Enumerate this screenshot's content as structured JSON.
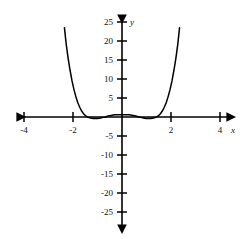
{
  "chart_data": {
    "type": "line",
    "title": "",
    "subtitle": "",
    "xlabel": "x",
    "ylabel": "y",
    "xlim": [
      -4.6,
      4.6
    ],
    "ylim": [
      -27.5,
      27.5
    ],
    "grid": false,
    "legend": null,
    "x_ticks": [
      -4,
      -2,
      2,
      4
    ],
    "x_tick_labels": [
      "-4",
      "-2",
      "2",
      "4"
    ],
    "y_ticks": [
      -25,
      -20,
      -15,
      -10,
      -5,
      5,
      10,
      15,
      20,
      25
    ],
    "y_tick_labels": [
      "-25",
      "-20",
      "-15",
      "-10",
      "-5",
      "5",
      "10",
      "15",
      "20",
      "25"
    ],
    "axis_arrows": true,
    "series": [
      {
        "name": "curve",
        "color": "#000000",
        "x": [
          -2.42,
          -2.35,
          -2.28,
          -2.2,
          -2.12,
          -2.04,
          -1.96,
          -1.88,
          -1.8,
          -1.72,
          -1.64,
          -1.56,
          -1.48,
          -1.4,
          -1.32,
          -1.24,
          -1.16,
          -1.08,
          -1.0,
          -0.92,
          -0.84,
          -0.76,
          -0.68,
          -0.6,
          -0.52,
          -0.44,
          -0.36,
          -0.28,
          -0.2,
          -0.12,
          -0.04,
          0.04,
          0.12,
          0.2,
          0.28,
          0.36,
          0.44,
          0.52,
          0.6,
          0.68,
          0.76,
          0.84,
          0.92,
          1.0,
          1.08,
          1.16,
          1.24,
          1.32,
          1.4,
          1.48,
          1.56,
          1.64,
          1.72,
          1.8,
          1.88,
          1.96,
          2.04,
          2.12,
          2.2,
          2.28,
          2.35,
          2.42
        ],
        "y": [
          28.3,
          23.5,
          19.3,
          15.5,
          12.3,
          9.5,
          7.2,
          5.3,
          3.7,
          2.5,
          1.5,
          0.8,
          0.3,
          0.0,
          -0.2,
          -0.3,
          -0.4,
          -0.4,
          -0.4,
          -0.3,
          -0.2,
          -0.1,
          0.0,
          0.2,
          0.3,
          0.4,
          0.5,
          0.6,
          0.6,
          0.6,
          0.6,
          0.6,
          0.6,
          0.6,
          0.6,
          0.5,
          0.4,
          0.3,
          0.2,
          0.0,
          -0.1,
          -0.2,
          -0.3,
          -0.4,
          -0.4,
          -0.4,
          -0.3,
          -0.2,
          0.0,
          0.3,
          0.8,
          1.5,
          2.5,
          3.7,
          5.3,
          7.2,
          9.5,
          12.3,
          15.5,
          19.3,
          23.5,
          28.3
        ],
        "features": {
          "shape": "even-degree polynomial, symmetric about y-axis",
          "local_maximum_near_origin": 0.6,
          "local_minima_approx_x": [
            -1.1,
            1.1
          ],
          "x_intercepts_approx": [
            -1.4,
            1.4
          ],
          "branches_exit_top_at_x": [
            -2.4,
            2.4
          ]
        }
      }
    ]
  },
  "colors": {
    "background": "#ffffff",
    "axis": "#000000",
    "curve": "#000000",
    "text": "#111111"
  }
}
